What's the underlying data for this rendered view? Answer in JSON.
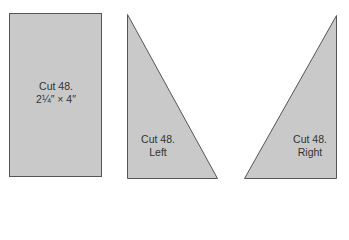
{
  "colors": {
    "fill": "#c9c9c9",
    "stroke": "#555555",
    "text": "#333333",
    "background": "#ffffff"
  },
  "pieces": [
    {
      "shape": "rectangle",
      "line1": "Cut 48.",
      "line2": "2¼″ × 4″"
    },
    {
      "shape": "right-triangle-left",
      "line1": "Cut 48.",
      "line2": "Left"
    },
    {
      "shape": "right-triangle-right",
      "line1": "Cut 48.",
      "line2": "Right"
    }
  ]
}
